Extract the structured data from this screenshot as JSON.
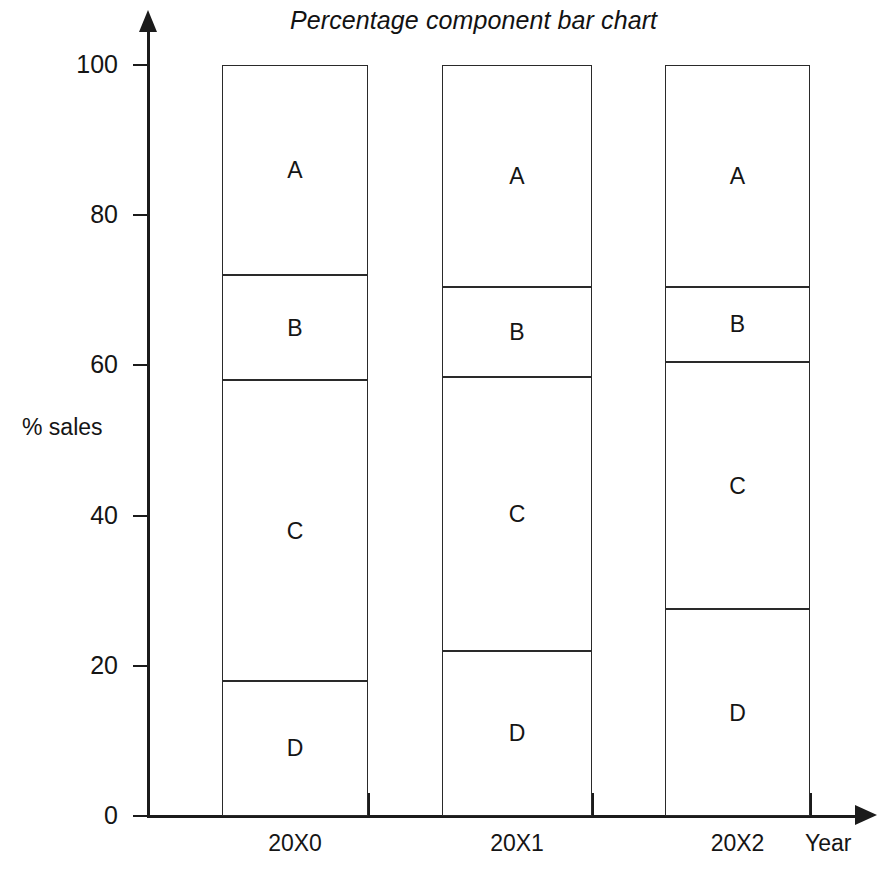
{
  "chart_data": {
    "type": "bar",
    "subtype": "percentage-component-stacked-bar",
    "title": "Percentage component bar chart",
    "xlabel": "Year",
    "ylabel": "% sales",
    "categories": [
      "20X0",
      "20X1",
      "20X2"
    ],
    "series": [
      {
        "name": "A",
        "values": [
          28,
          29.5,
          29.5
        ]
      },
      {
        "name": "B",
        "values": [
          14,
          12,
          10
        ]
      },
      {
        "name": "C",
        "values": [
          40,
          36.5,
          33
        ]
      },
      {
        "name": "D",
        "values": [
          18,
          22,
          27.5
        ]
      }
    ],
    "stack_order_bottom_to_top": [
      "D",
      "C",
      "B",
      "A"
    ],
    "ylim": [
      0,
      100
    ],
    "yticks": [
      0,
      20,
      40,
      60,
      80,
      100
    ],
    "ytick_labels": [
      "0",
      "20",
      "40",
      "60",
      "80",
      "100"
    ],
    "xtick_labels": [
      "20X0",
      "20X1",
      "20X2"
    ],
    "grid": false,
    "legend": "none",
    "segment_labels_inside": true,
    "bar_fill_color": "#ffffff",
    "bar_border_color": "#2a2a2a",
    "axis_color": "#1b1b1b",
    "background_color": "#ffffff"
  },
  "bars": [
    {
      "category": "20X0",
      "segments": [
        {
          "label": "A",
          "value": 28,
          "bottom": 72,
          "top": 100
        },
        {
          "label": "B",
          "value": 14,
          "bottom": 58,
          "top": 72
        },
        {
          "label": "C",
          "value": 40,
          "bottom": 18,
          "top": 58
        },
        {
          "label": "D",
          "value": 18,
          "bottom": 0,
          "top": 18
        }
      ]
    },
    {
      "category": "20X1",
      "segments": [
        {
          "label": "A",
          "value": 29.5,
          "bottom": 70.5,
          "top": 100
        },
        {
          "label": "B",
          "value": 12,
          "bottom": 58.5,
          "top": 70.5
        },
        {
          "label": "C",
          "value": 36.5,
          "bottom": 22,
          "top": 58.5
        },
        {
          "label": "D",
          "value": 22,
          "bottom": 0,
          "top": 22
        }
      ]
    },
    {
      "category": "20X2",
      "segments": [
        {
          "label": "A",
          "value": 29.5,
          "bottom": 70.5,
          "top": 100
        },
        {
          "label": "B",
          "value": 10,
          "bottom": 60.5,
          "top": 70.5
        },
        {
          "label": "C",
          "value": 33,
          "bottom": 27.5,
          "top": 60.5
        },
        {
          "label": "D",
          "value": 27.5,
          "bottom": 0,
          "top": 27.5
        }
      ]
    }
  ]
}
